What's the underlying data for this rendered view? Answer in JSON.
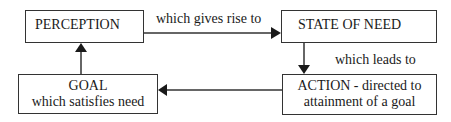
{
  "diagram": {
    "type": "flow-cycle",
    "nodes": [
      {
        "id": "perception",
        "lines": [
          "PERCEPTION"
        ]
      },
      {
        "id": "state_of_need",
        "lines": [
          "STATE OF NEED"
        ]
      },
      {
        "id": "action",
        "lines": [
          "ACTION - directed to",
          "attainment of a goal"
        ]
      },
      {
        "id": "goal",
        "lines": [
          "GOAL",
          "which satisfies need"
        ]
      }
    ],
    "edges": [
      {
        "from": "perception",
        "to": "state_of_need",
        "label": "which gives rise to"
      },
      {
        "from": "state_of_need",
        "to": "action",
        "label": "which leads to"
      },
      {
        "from": "action",
        "to": "goal",
        "label": ""
      },
      {
        "from": "goal",
        "to": "perception",
        "label": ""
      }
    ]
  },
  "colors": {
    "stroke": "#333333",
    "text": "#1a1a1a",
    "background": "#ffffff"
  }
}
